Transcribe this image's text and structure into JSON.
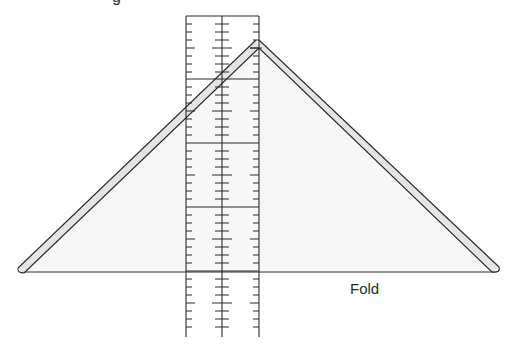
{
  "diagram": {
    "title_fragment": "g",
    "fold_label": "Fold",
    "colors": {
      "stroke": "#2b2b2b",
      "triangle_fill": "#f7f7f7",
      "strip_fill": "#e4e4e4",
      "background": "#ffffff"
    },
    "triangle": {
      "apex": [
        259,
        40
      ],
      "left_corner": [
        20,
        270
      ],
      "right_corner": [
        497,
        270
      ],
      "baseline_y": 272
    },
    "ruler": {
      "left_x": 186,
      "center_x": 222,
      "right_x": 259,
      "top_y": 16,
      "bottom_y": 337,
      "major_lines_y": [
        79,
        143,
        207,
        271
      ],
      "tick_spacing": 8,
      "ticks_per_segment": 7
    }
  }
}
